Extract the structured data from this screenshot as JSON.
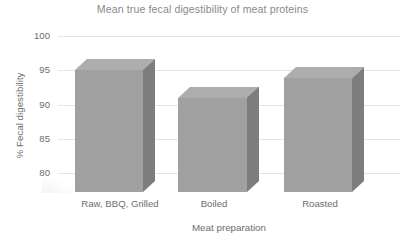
{
  "chart_data": {
    "type": "bar",
    "title": "Mean true fecal digestibility of meat proteins",
    "xlabel": "Meat preparation",
    "ylabel": "% Fecal digestibility",
    "categories": [
      "Raw, BBQ, Grilled",
      "Boiled",
      "Roasted"
    ],
    "values": [
      95.0,
      91.0,
      93.8
    ],
    "ylim": [
      80,
      100
    ],
    "yticks": [
      100,
      95,
      90,
      85,
      80
    ],
    "ytick_labels": [
      "100",
      "95",
      "90",
      "85",
      "80"
    ],
    "grid": true,
    "legend": false,
    "style": "3d-bar",
    "colors": {
      "bar_front": "#a0a0a0",
      "bar_side": "#7d7d7d",
      "bar_top": "#adadad",
      "gridline": "#e4e4e4",
      "text": "#6d6d6d",
      "title_text": "#8a8a8a",
      "background": "#ffffff"
    }
  }
}
